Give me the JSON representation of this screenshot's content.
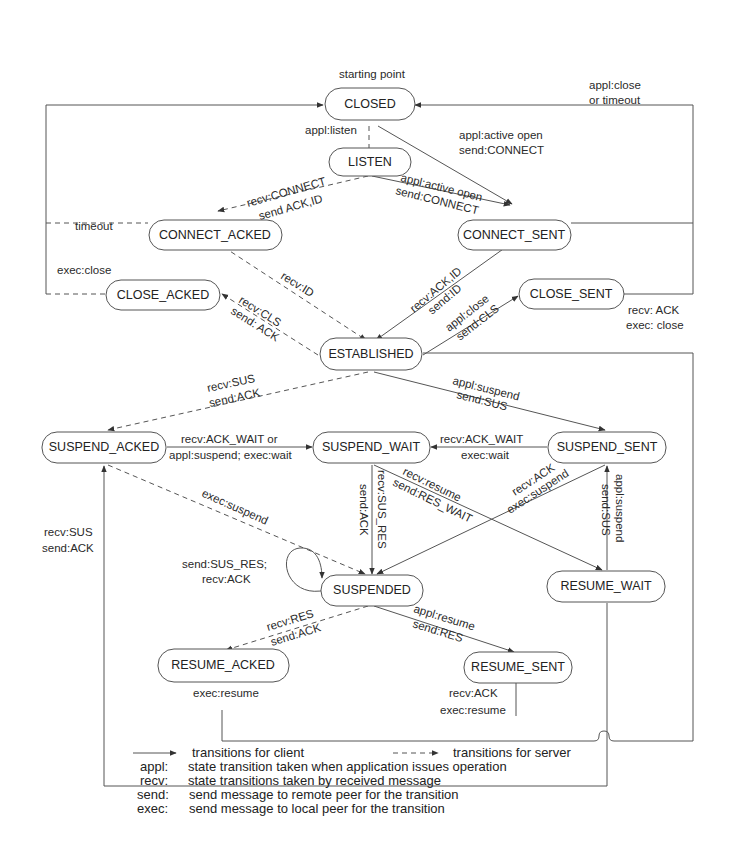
{
  "diagram": {
    "start_label": "starting point",
    "states": {
      "closed": "CLOSED",
      "listen": "LISTEN",
      "connect_acked": "CONNECT_ACKED",
      "connect_sent": "CONNECT_SENT",
      "close_acked": "CLOSE_ACKED",
      "close_sent": "CLOSE_SENT",
      "established": "ESTABLISHED",
      "suspend_acked": "SUSPEND_ACKED",
      "suspend_wait": "SUSPEND_WAIT",
      "suspend_sent": "SUSPEND_SENT",
      "suspended": "SUSPENDED",
      "resume_wait": "RESUME_WAIT",
      "resume_acked": "RESUME_ACKED",
      "resume_sent": "RESUME_SENT"
    },
    "transitions": {
      "appl_listen": "appl:listen",
      "closed_connect_sent_1": "appl:active open",
      "closed_connect_sent_2": "send:CONNECT",
      "close_or_timeout_1": "appl:close",
      "close_or_timeout_2": "or timeout",
      "listen_connect_acked_1": "recv:CONNECT",
      "listen_connect_acked_2": "send ACK,ID",
      "listen_connect_sent_1": "appl:active open",
      "listen_connect_sent_2": "send:CONNECT",
      "timeout": "timeout",
      "exec_close": "exec:close",
      "recv_id": "recv:ID",
      "connect_sent_established_1": "recv:ACK,ID",
      "connect_sent_established_2": "send:ID",
      "established_close_acked_1": "recv:CLS",
      "established_close_acked_2": "send: ACK",
      "established_close_sent_1": "appl:close",
      "established_close_sent_2": "send:CLS",
      "close_sent_closed_1": "recv: ACK",
      "close_sent_closed_2": "exec: close",
      "established_suspend_acked_1": "recv:SUS",
      "established_suspend_acked_2": "send:ACK",
      "established_suspend_sent_1": "appl:suspend",
      "established_suspend_sent_2": "send:SUS",
      "suspend_acked_wait_1": "recv:ACK_WAIT or",
      "suspend_acked_wait_2": "appl:suspend; exec:wait",
      "suspend_sent_wait_1": "recv:ACK_WAIT",
      "suspend_sent_wait_2": "exec:wait",
      "exec_suspend": "exec:suspend",
      "wait_suspended_1": "recv:SUS_RES",
      "wait_suspended_2": "send:ACK",
      "wait_resume_wait_1": "recv:resume",
      "wait_resume_wait_2": "send:RES_WAIT",
      "sent_suspended_1": "recv:ACK",
      "sent_suspended_2": "exec:suspend",
      "resume_wait_sent_1": "appl:suspend",
      "resume_wait_sent_2": "send:SUS",
      "resume_to_acked_1": "recv:SUS",
      "resume_to_acked_2": "send:ACK",
      "self_loop_1": "send:SUS_RES;",
      "self_loop_2": "recv:ACK",
      "suspended_resume_acked_1": "recv:RES",
      "suspended_resume_acked_2": "send:ACK",
      "suspended_resume_sent_1": "appl:resume",
      "suspended_resume_sent_2": "send:RES",
      "resume_acked_exec": "exec:resume",
      "resume_sent_1": "recv:ACK",
      "resume_sent_2": "exec:resume"
    }
  },
  "legend": {
    "client": "transitions for client",
    "server": "transitions for server",
    "items": [
      {
        "key": "appl:",
        "desc": "state transition taken when application issues operation"
      },
      {
        "key": "recv:",
        "desc": "state transitions taken by received message"
      },
      {
        "key": "send:",
        "desc": "send message to remote peer for the transition"
      },
      {
        "key": "exec:",
        "desc": "send message to local peer for the transition"
      }
    ]
  }
}
